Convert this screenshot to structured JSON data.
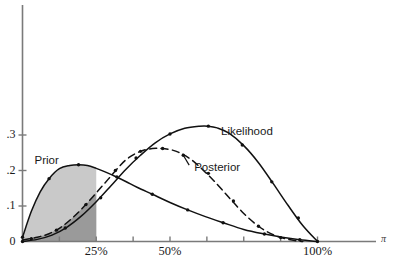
{
  "chart_data": {
    "type": "line",
    "title": "",
    "subtitle": "",
    "xlabel": "π",
    "ylabel": "",
    "xlim": [
      0,
      1.18
    ],
    "ylim": [
      0,
      0.4
    ],
    "grid": false,
    "legend_position": "inline-annotations",
    "x_tick_labels": [
      "25%",
      "50%",
      "100%"
    ],
    "x_tick_values": [
      0.25,
      0.5,
      1.0
    ],
    "x_minor_ticks": [
      0.125,
      0.375,
      0.625,
      0.75,
      0.875
    ],
    "y_tick_labels": [
      "0",
      ".1",
      ".2",
      ".3"
    ],
    "y_tick_values": [
      0,
      0.1,
      0.2,
      0.3
    ],
    "annotations": [
      {
        "text": "Prior",
        "x": 0.095,
        "y": 0.225
      },
      {
        "text": "Likelihood",
        "x": 0.7,
        "y": 0.305
      },
      {
        "text": "Posterior",
        "x": 0.575,
        "y": 0.205
      }
    ],
    "series": [
      {
        "name": "Prior",
        "style": "solid",
        "color": "#111111",
        "shaded": true,
        "shade_to_x": 0.25,
        "shade_color_light": "#c9c9c9",
        "shade_color_dark": "#9a9a9a",
        "x": [
          0.0,
          0.03,
          0.06,
          0.09,
          0.125,
          0.16,
          0.19,
          0.22,
          0.25,
          0.28,
          0.315,
          0.35,
          0.39,
          0.44,
          0.5,
          0.56,
          0.62,
          0.68,
          0.75,
          0.82,
          0.88,
          0.94,
          1.0
        ],
        "y": [
          0.012,
          0.085,
          0.14,
          0.177,
          0.205,
          0.214,
          0.216,
          0.214,
          0.206,
          0.196,
          0.183,
          0.169,
          0.152,
          0.133,
          0.11,
          0.089,
          0.07,
          0.053,
          0.034,
          0.021,
          0.012,
          0.005,
          0.0
        ],
        "markers_x": [
          0.0,
          0.09,
          0.19,
          0.32,
          0.44,
          0.56,
          0.68,
          0.82,
          0.94
        ],
        "markers_y": [
          0.012,
          0.177,
          0.216,
          0.182,
          0.133,
          0.089,
          0.053,
          0.021,
          0.005
        ]
      },
      {
        "name": "Likelihood",
        "style": "solid",
        "color": "#111111",
        "shaded": false,
        "x": [
          0.0,
          0.05,
          0.1,
          0.15,
          0.2,
          0.25,
          0.3,
          0.35,
          0.4,
          0.45,
          0.5,
          0.55,
          0.6,
          0.63,
          0.66,
          0.7,
          0.75,
          0.8,
          0.85,
          0.9,
          0.95,
          1.0
        ],
        "y": [
          0.0,
          0.006,
          0.018,
          0.04,
          0.072,
          0.112,
          0.157,
          0.203,
          0.243,
          0.278,
          0.303,
          0.319,
          0.325,
          0.325,
          0.32,
          0.305,
          0.27,
          0.222,
          0.163,
          0.102,
          0.045,
          0.0
        ],
        "markers_x": [
          0.0,
          0.145,
          0.265,
          0.385,
          0.5,
          0.63,
          0.745,
          0.845,
          0.935,
          1.0
        ],
        "markers_y": [
          0.0,
          0.038,
          0.123,
          0.235,
          0.303,
          0.325,
          0.272,
          0.168,
          0.066,
          0.0
        ]
      },
      {
        "name": "Posterior",
        "style": "dashed",
        "color": "#111111",
        "shaded": false,
        "x": [
          0.0,
          0.05,
          0.09,
          0.13,
          0.17,
          0.21,
          0.25,
          0.29,
          0.33,
          0.36,
          0.4,
          0.44,
          0.47,
          0.5,
          0.53,
          0.57,
          0.61,
          0.65,
          0.7,
          0.75,
          0.8,
          0.85,
          0.9,
          0.95
        ],
        "y": [
          0.004,
          0.012,
          0.022,
          0.04,
          0.067,
          0.1,
          0.137,
          0.175,
          0.213,
          0.236,
          0.254,
          0.262,
          0.262,
          0.259,
          0.251,
          0.232,
          0.203,
          0.17,
          0.124,
          0.079,
          0.043,
          0.019,
          0.006,
          0.0
        ],
        "markers_x": [
          0.03,
          0.115,
          0.215,
          0.315,
          0.4,
          0.475,
          0.545,
          0.63,
          0.715,
          0.8,
          0.875
        ],
        "markers_y": [
          0.008,
          0.032,
          0.104,
          0.2,
          0.254,
          0.262,
          0.243,
          0.192,
          0.114,
          0.043,
          0.011
        ]
      }
    ]
  },
  "axis": {
    "y_axis_color": "#7a7a7a",
    "x_axis_color": "#7a7a7a"
  }
}
